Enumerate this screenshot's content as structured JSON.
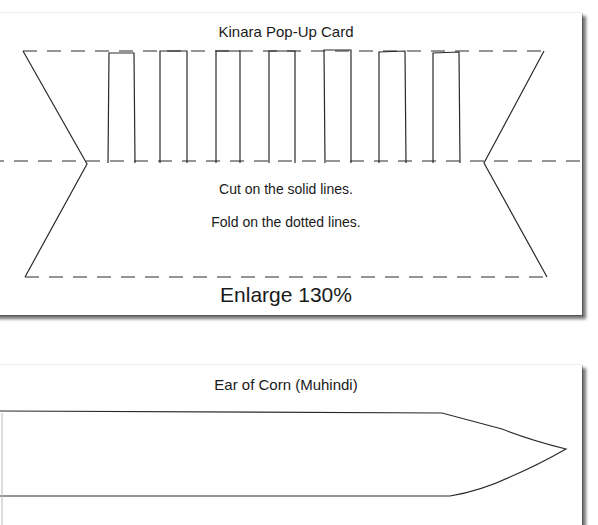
{
  "kinara_card": {
    "title": "Kinara Pop-Up Card",
    "instructions": {
      "cut": "Cut on the solid lines.",
      "fold": "Fold on the dotted lines."
    },
    "scale_note": "Enlarge 130%",
    "candle_count": 7,
    "line_styles": {
      "cut": "solid",
      "fold": "dashed"
    }
  },
  "corn_card": {
    "title": "Ear of Corn (Muhindi)"
  },
  "colors": {
    "paper": "#ffffff",
    "ink": "#1a1a1a",
    "shadow": "#555555"
  }
}
